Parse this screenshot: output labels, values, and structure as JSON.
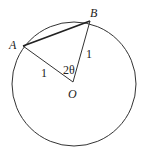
{
  "diagram": {
    "points": {
      "A": {
        "label": "A"
      },
      "B": {
        "label": "B"
      },
      "O": {
        "label": "O"
      }
    },
    "labels": {
      "oa_length": "1",
      "ob_length": "1",
      "angle": "2θ"
    }
  }
}
